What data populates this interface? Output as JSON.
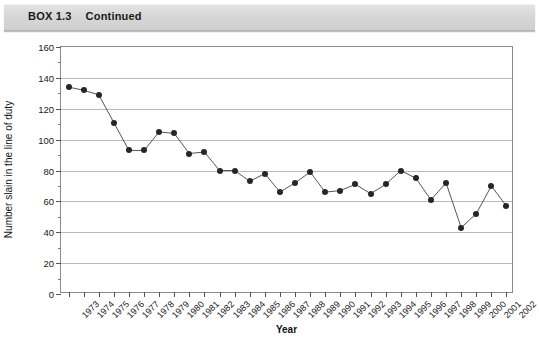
{
  "header": {
    "box_label": "BOX 1.3",
    "continued_label": "Continued"
  },
  "chart_data": {
    "type": "line",
    "title": "",
    "xlabel": "Year",
    "ylabel": "Number slain in the line of duty",
    "ylim": [
      0,
      160
    ],
    "ytick_step": 20,
    "yticks": [
      0,
      20,
      40,
      60,
      80,
      100,
      120,
      140,
      160
    ],
    "grid": true,
    "legend": "none",
    "marker": "filled-circle",
    "line_color": "#555555",
    "marker_color": "#262626",
    "categories": [
      "1973",
      "1974",
      "1975",
      "1976",
      "1977",
      "1978",
      "1979",
      "1980",
      "1981",
      "1982",
      "1983",
      "1984",
      "1985",
      "1986",
      "1987",
      "1988",
      "1989",
      "1990",
      "1991",
      "1992",
      "1993",
      "1994",
      "1995",
      "1996",
      "1997",
      "1998",
      "1999",
      "2000",
      "2001",
      "2002"
    ],
    "values": [
      134,
      132,
      129,
      111,
      93,
      93,
      105,
      104,
      91,
      92,
      80,
      80,
      73,
      78,
      66,
      72,
      79,
      66,
      67,
      71,
      65,
      71,
      80,
      75,
      61,
      72,
      66,
      61,
      43,
      52
    ],
    "series": [
      {
        "name": "Officers slain in the line of duty",
        "x": [
          "1973",
          "1974",
          "1975",
          "1976",
          "1977",
          "1978",
          "1979",
          "1980",
          "1981",
          "1982",
          "1983",
          "1984",
          "1985",
          "1986",
          "1987",
          "1988",
          "1989",
          "1990",
          "1991",
          "1992",
          "1993",
          "1994",
          "1995",
          "1996",
          "1997",
          "1998",
          "1999",
          "2000",
          "2001",
          "2002"
        ],
        "values": [
          134,
          132,
          129,
          111,
          93,
          93,
          105,
          104,
          91,
          92,
          80,
          80,
          73,
          78,
          66,
          72,
          79,
          66,
          67,
          71,
          65,
          71,
          80,
          75,
          61,
          72,
          43,
          52,
          70,
          57
        ]
      }
    ]
  }
}
